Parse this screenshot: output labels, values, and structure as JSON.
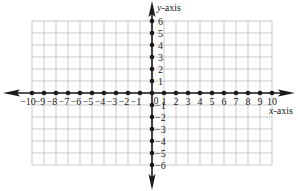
{
  "diagram": {
    "type": "coordinate-plane",
    "x_axis_label_var": "x",
    "x_axis_label_suffix": "-axis",
    "y_axis_label_var": "y",
    "y_axis_label_suffix": "-axis",
    "x_ticks": [
      -10,
      -9,
      -8,
      -7,
      -6,
      -5,
      -4,
      -3,
      -2,
      -1,
      1,
      2,
      3,
      4,
      5,
      6,
      7,
      8,
      9,
      10
    ],
    "y_ticks": [
      6,
      5,
      4,
      3,
      2,
      1,
      -1,
      -2,
      -3,
      -4,
      -5,
      -6
    ],
    "origin_label": "0",
    "x_range": [
      -10,
      10
    ],
    "y_range": [
      -6,
      6
    ],
    "grid": true,
    "colors": {
      "axis": "#1a1a1a",
      "grid": "#bdbdbd",
      "text": "#222222"
    }
  }
}
